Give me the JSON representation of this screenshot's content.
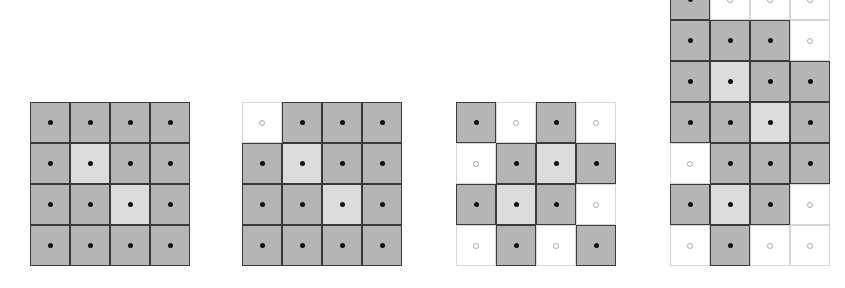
{
  "figure": {
    "colors": {
      "filled": "#b5b5b5",
      "light": "#dcdcdc",
      "empty": "#ffffff",
      "border": "#3a3a3a",
      "dot": "#111111"
    },
    "cell_size": 40,
    "panels": [
      {
        "name": "panel-1",
        "left": 30,
        "top": 102,
        "cols": 4,
        "rows": [
          [
            "F",
            "F",
            "F",
            "F"
          ],
          [
            "F",
            "L",
            "F",
            "F"
          ],
          [
            "F",
            "F",
            "L",
            "F"
          ],
          [
            "F",
            "F",
            "F",
            "F"
          ]
        ]
      },
      {
        "name": "panel-2",
        "left": 242,
        "top": 102,
        "cols": 4,
        "rows": [
          [
            "E",
            "F",
            "F",
            "F"
          ],
          [
            "F",
            "L",
            "F",
            "F"
          ],
          [
            "F",
            "F",
            "L",
            "F"
          ],
          [
            "F",
            "F",
            "F",
            "F"
          ]
        ]
      },
      {
        "name": "panel-3",
        "left": 456,
        "top": 102,
        "cols": 4,
        "rows": [
          [
            "F",
            "E",
            "F",
            "E"
          ],
          [
            "E",
            "F",
            "L",
            "F"
          ],
          [
            "F",
            "L",
            "F",
            "E"
          ],
          [
            "E",
            "F",
            "E",
            "F"
          ]
        ]
      },
      {
        "name": "panel-4",
        "left": 670,
        "top": -21,
        "cols": 4,
        "rows": [
          [
            "F",
            "E",
            "E",
            "E"
          ],
          [
            "F",
            "F",
            "F",
            "E"
          ],
          [
            "F",
            "L",
            "F",
            "F"
          ],
          [
            "F",
            "F",
            "L",
            "F"
          ],
          [
            "E",
            "F",
            "F",
            "F"
          ],
          [
            "F",
            "L",
            "F",
            "E"
          ],
          [
            "E",
            "F",
            "E",
            "E"
          ]
        ]
      }
    ]
  }
}
